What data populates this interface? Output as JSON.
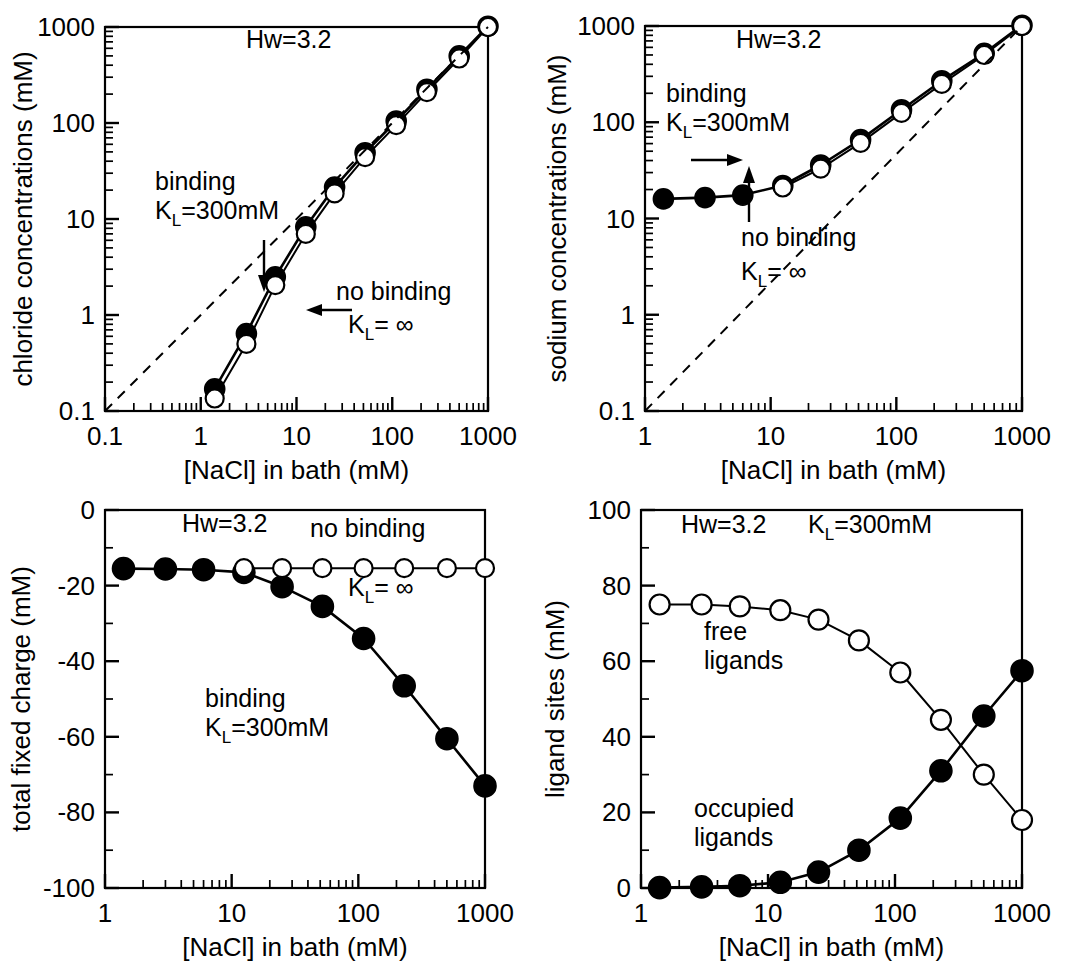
{
  "figure": {
    "common_xlabel": "[NaCl] in bath (mM)",
    "hw_label": "Hw=3.2",
    "kl_binding": "K",
    "kl_sub": "L",
    "kl_binding_val": "=300mM",
    "kl_inf_val": "= ∞",
    "binding_word": "binding",
    "no_binding_word": "no binding"
  },
  "chart_data": [
    {
      "id": "panel-chloride",
      "type": "line",
      "title": "",
      "annotation_hw": "Hw=3.2",
      "xlabel": "[NaCl] in bath (mM)",
      "ylabel": "chloride concentrations (mM)",
      "xscale": "log",
      "yscale": "log",
      "xlim": [
        0.1,
        1000
      ],
      "ylim": [
        0.1,
        1000
      ],
      "xticks": [
        0.1,
        1,
        10,
        100,
        1000
      ],
      "xticklabels": [
        "0.1",
        "1",
        "10",
        "100",
        "1000"
      ],
      "yticks": [
        0.1,
        1,
        10,
        100,
        1000
      ],
      "yticklabels": [
        "0.1",
        "1",
        "10",
        "100",
        "1000"
      ],
      "grid": false,
      "legend": "none",
      "annotations": [
        {
          "text": "binding",
          "sub": "",
          "x": 0.5,
          "y": 20
        },
        {
          "text": "K",
          "sub": "L",
          "tail": "=300mM",
          "x": 0.5,
          "y": 12
        },
        {
          "text": "no binding",
          "x": 12,
          "y": 2.2
        },
        {
          "text": "K",
          "sub": "L",
          "tail": "= ∞",
          "x": 12,
          "y": 1.3
        }
      ],
      "series": [
        {
          "name": "binding K_L=300mM",
          "marker": "filled-circle",
          "x": [
            1.4,
            3.0,
            6.0,
            12.5,
            25,
            52,
            110,
            230,
            500,
            1000
          ],
          "values": [
            0.17,
            0.64,
            2.5,
            8.3,
            21.5,
            49,
            105,
            225,
            500,
            1020
          ]
        },
        {
          "name": "no binding K_L=infinity",
          "marker": "open-circle",
          "x": [
            1.4,
            3.0,
            6.0,
            12.5,
            25,
            52,
            110,
            230,
            500,
            1000
          ],
          "values": [
            0.135,
            0.5,
            2.05,
            7.0,
            18.5,
            44,
            95,
            210,
            470,
            1000
          ]
        },
        {
          "name": "identity reference",
          "marker": "none",
          "style": "dashed",
          "x": [
            0.1,
            1000
          ],
          "values": [
            0.1,
            1000
          ]
        }
      ]
    },
    {
      "id": "panel-sodium",
      "type": "line",
      "title": "",
      "annotation_hw": "Hw=3.2",
      "xlabel": "[NaCl] in bath (mM)",
      "ylabel": "sodium concentrations (mM)",
      "xscale": "log",
      "yscale": "log",
      "xlim": [
        1,
        1000
      ],
      "ylim": [
        0.1,
        1000
      ],
      "xticks": [
        1,
        10,
        100,
        1000
      ],
      "xticklabels": [
        "1",
        "10",
        "100",
        "1000"
      ],
      "yticks": [
        0.1,
        1,
        10,
        100,
        1000
      ],
      "yticklabels": [
        "0.1",
        "1",
        "10",
        "100",
        "1000"
      ],
      "grid": false,
      "legend": "none",
      "annotations": [
        {
          "text": "binding",
          "x": 3.2,
          "y": 210
        },
        {
          "text": "K",
          "sub": "L",
          "tail": "=300mM",
          "x": 3.2,
          "y": 120
        },
        {
          "text": "no binding",
          "x": 33,
          "y": 7.5
        },
        {
          "text": "K",
          "sub": "L",
          "tail": "= ∞",
          "x": 33,
          "y": 3.2
        }
      ],
      "series": [
        {
          "name": "binding K_L=300mM",
          "marker": "filled-circle",
          "x": [
            1.4,
            3.0,
            6.0,
            12.5,
            25,
            52,
            110,
            230,
            500,
            1000
          ],
          "values": [
            16,
            16.5,
            17.5,
            22,
            36,
            66,
            135,
            270,
            520,
            1020
          ]
        },
        {
          "name": "no binding K_L=infinity",
          "marker": "open-circle",
          "x": [
            12.5,
            25,
            52,
            110,
            230,
            500,
            1000
          ],
          "values": [
            21,
            33,
            61,
            125,
            250,
            500,
            1000
          ]
        },
        {
          "name": "identity reference",
          "marker": "none",
          "style": "dashed",
          "x": [
            1,
            1000
          ],
          "values": [
            0.1,
            1000
          ]
        }
      ]
    },
    {
      "id": "panel-fixed-charge",
      "type": "line",
      "title": "",
      "annotation_hw": "Hw=3.2",
      "xlabel": "[NaCl] in bath (mM)",
      "ylabel": "total fixed charge (mM)",
      "xscale": "log",
      "yscale": "linear",
      "xlim": [
        1,
        1000
      ],
      "ylim": [
        -100,
        0
      ],
      "xticks": [
        1,
        10,
        100,
        1000
      ],
      "xticklabels": [
        "1",
        "10",
        "100",
        "1000"
      ],
      "yticks": [
        0,
        -20,
        -40,
        -60,
        -80,
        -100
      ],
      "yticklabels": [
        "0",
        "-20",
        "-40",
        "-60",
        "-80",
        "-100"
      ],
      "grid": false,
      "legend": "none",
      "annotations": [
        {
          "text": "no binding",
          "x": 150,
          "y": -6
        },
        {
          "text": "K",
          "sub": "L",
          "tail": "= ∞",
          "x": 210,
          "y": -19
        },
        {
          "text": "binding",
          "x": 28,
          "y": -52
        },
        {
          "text": "K",
          "sub": "L",
          "tail": "=300mM",
          "x": 28,
          "y": -60
        }
      ],
      "series": [
        {
          "name": "binding K_L=300mM",
          "marker": "filled-circle",
          "x": [
            1.4,
            3.0,
            6.0,
            12.5,
            25,
            52,
            110,
            230,
            500,
            1000
          ],
          "values": [
            -15.5,
            -15.6,
            -15.8,
            -16.5,
            -20.3,
            -25.5,
            -34,
            -46.5,
            -60.5,
            -73
          ]
        },
        {
          "name": "no binding K_L=infinity",
          "marker": "open-circle",
          "x": [
            12.5,
            25,
            52,
            110,
            230,
            500,
            1000
          ],
          "values": [
            -15.4,
            -15.4,
            -15.4,
            -15.4,
            -15.4,
            -15.4,
            -15.4
          ]
        }
      ]
    },
    {
      "id": "panel-ligand-sites",
      "type": "line",
      "title": "",
      "annotation_hw": "Hw=3.2",
      "annotation_kl": "=300mM",
      "xlabel": "[NaCl] in bath (mM)",
      "ylabel": "ligand sites (mM)",
      "xscale": "log",
      "yscale": "linear",
      "xlim": [
        1,
        1000
      ],
      "ylim": [
        0,
        100
      ],
      "xticks": [
        1,
        10,
        100,
        1000
      ],
      "xticklabels": [
        "1",
        "10",
        "100",
        "1000"
      ],
      "yticks": [
        0,
        20,
        40,
        60,
        80,
        100
      ],
      "yticklabels": [
        "0",
        "20",
        "40",
        "60",
        "80",
        "100"
      ],
      "grid": false,
      "legend": "none",
      "annotations": [
        {
          "text": "free",
          "x": 6.0,
          "y": 65
        },
        {
          "text": "ligands",
          "x": 6.0,
          "y": 58
        },
        {
          "text": "occupied",
          "x": 5.5,
          "y": 21
        },
        {
          "text": "ligands",
          "x": 5.5,
          "y": 14
        }
      ],
      "series": [
        {
          "name": "free ligands",
          "marker": "open-circle",
          "x": [
            1.4,
            3.0,
            6.0,
            12.5,
            25,
            52,
            110,
            230,
            500,
            1000
          ],
          "values": [
            75,
            75,
            74.5,
            73.5,
            71,
            65.5,
            57,
            44.5,
            30,
            18
          ]
        },
        {
          "name": "occupied ligands",
          "marker": "filled-circle",
          "x": [
            1.4,
            3.0,
            6.0,
            12.5,
            25,
            52,
            110,
            230,
            500,
            1000
          ],
          "values": [
            0.1,
            0.3,
            0.6,
            1.5,
            4.2,
            10,
            18.5,
            31,
            45.5,
            57.5
          ]
        }
      ]
    }
  ]
}
